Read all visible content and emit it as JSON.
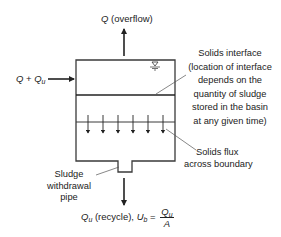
{
  "diagram": {
    "type": "settling-basin-schematic",
    "labels": {
      "overflow": {
        "symbol": "Q",
        "text": " (overflow)"
      },
      "inflow": {
        "symbol": "Q",
        "plus": " + ",
        "symbol2": "Q",
        "sub2": "u"
      },
      "interface": {
        "lines": [
          "Solids interface",
          "(location of interface",
          "depends on the",
          "quantity of sludge",
          "stored in the basin",
          "at any given time)"
        ]
      },
      "flux": {
        "lines": [
          "Solids flux",
          "across boundary"
        ]
      },
      "sludge_pipe": {
        "lines": [
          "Sludge",
          "withdrawal",
          "pipe"
        ]
      },
      "recycle": {
        "symbol": "Q",
        "sub": "u",
        "text": " (recycle), ",
        "symbol2": "U",
        "sub2": "b",
        "equals": " = ",
        "frac_num_symbol": "Q",
        "frac_num_sub": "u",
        "frac_den": "A"
      }
    },
    "flux_arrow_count": 6,
    "water_surface_symbol": "▽",
    "colors": {
      "line": "#3a3a3a",
      "text": "#222222",
      "background": "#ffffff"
    }
  }
}
